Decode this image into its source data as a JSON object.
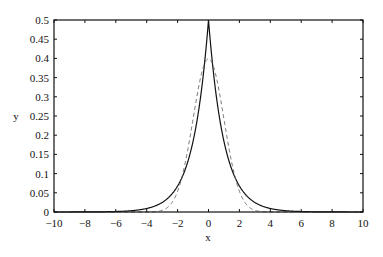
{
  "chart_data": {
    "type": "line",
    "title": "",
    "xlabel": "x",
    "ylabel": "y",
    "xlim": [
      -10,
      10
    ],
    "ylim": [
      0,
      0.5
    ],
    "grid": false,
    "legend": null,
    "x_ticks": [
      "-10",
      "-8",
      "-6",
      "-4",
      "-2",
      "0",
      "2",
      "4",
      "6",
      "8",
      "10"
    ],
    "y_ticks": [
      "0",
      "0.05",
      "0.1",
      "0.15",
      "0.2",
      "0.25",
      "0.3",
      "0.35",
      "0.4",
      "0.45",
      "0.5"
    ],
    "series": [
      {
        "name": "solid (Laplace density, 0.5·exp(-|x|))",
        "style": "solid",
        "color": "#111111",
        "x": [
          -10,
          -8,
          -6,
          -5,
          -4,
          -3,
          -2,
          -1.5,
          -1,
          -0.5,
          0,
          0.5,
          1,
          1.5,
          2,
          3,
          4,
          5,
          6,
          8,
          10
        ],
        "y": [
          0.0,
          0.0002,
          0.0012,
          0.0034,
          0.0092,
          0.0249,
          0.0677,
          0.1116,
          0.1839,
          0.3033,
          0.5,
          0.3033,
          0.1839,
          0.1116,
          0.0677,
          0.0249,
          0.0092,
          0.0034,
          0.0012,
          0.0002,
          0.0
        ]
      },
      {
        "name": "dashed (standard normal density)",
        "style": "dashed",
        "color": "#666666",
        "x": [
          -10,
          -4,
          -3.5,
          -3,
          -2.5,
          -2,
          -1.5,
          -1,
          -0.5,
          0,
          0.5,
          1,
          1.5,
          2,
          2.5,
          3,
          3.5,
          4,
          10
        ],
        "y": [
          0.0,
          0.0001,
          0.0009,
          0.0044,
          0.0175,
          0.054,
          0.1295,
          0.242,
          0.3521,
          0.3989,
          0.3521,
          0.242,
          0.1295,
          0.054,
          0.0175,
          0.0044,
          0.0009,
          0.0001,
          0.0
        ]
      }
    ]
  },
  "axes": {
    "xlabel": "x",
    "ylabel": "y"
  }
}
